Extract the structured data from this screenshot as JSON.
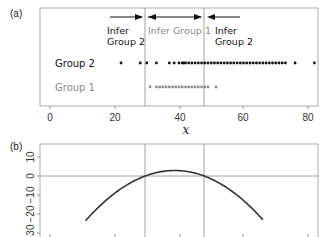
{
  "chart_data": [
    {
      "panel": "(a)",
      "type": "scatter",
      "title": "",
      "xlabel": "x",
      "ylabel": "",
      "xlim": [
        -3,
        83
      ],
      "x_ticks": [
        0,
        20,
        40,
        60,
        80
      ],
      "grid": false,
      "legend": null,
      "vertical_lines": [
        29.5,
        47.8
      ],
      "rows": [
        "Group 2",
        "Group 1"
      ],
      "annotations": [
        {
          "text": "Infer Group 2",
          "arrow": "right",
          "region": "x < 29.5",
          "color": "#111111"
        },
        {
          "text": "Infer Group 1",
          "arrow": "both",
          "region": "29.5 < x < 47.8",
          "color": "#8a8a8a"
        },
        {
          "text": "Infer Group 2",
          "arrow": "left",
          "region": "x > 47.8",
          "color": "#111111"
        }
      ],
      "series": [
        {
          "name": "Group 2",
          "color": "#111111",
          "values": [
            22,
            28,
            30,
            33,
            37,
            38.5,
            40,
            41,
            41.5,
            42,
            43,
            44,
            45,
            46,
            47,
            48,
            49,
            50,
            51,
            52,
            53,
            54,
            55,
            56,
            57,
            58,
            59,
            60,
            61,
            62,
            63,
            64,
            65,
            66,
            67,
            68,
            69,
            70,
            71,
            72,
            73,
            76,
            82
          ]
        },
        {
          "name": "Group 1",
          "color": "#8a8a8a",
          "values": [
            31,
            33,
            34,
            35,
            36,
            37,
            38,
            39,
            40,
            41,
            42,
            43,
            44,
            45,
            46,
            47,
            48,
            49,
            51.5
          ]
        }
      ]
    },
    {
      "panel": "(b)",
      "type": "line",
      "title": "",
      "xlabel": "",
      "ylabel": "",
      "xlim": [
        -3,
        83
      ],
      "ylim": [
        -31,
        17
      ],
      "y_ticks": [
        10,
        0,
        -10,
        -20,
        -30
      ],
      "y_tick_labels": [
        "10",
        "0",
        "−10",
        "−20",
        "−30"
      ],
      "grid": false,
      "horizontal_lines": [
        0
      ],
      "vertical_lines": [
        29.5,
        47.8
      ],
      "series": [
        {
          "name": "log-likelihood ratio (quadratic)",
          "color": "#333333",
          "x": [
            12,
            20,
            29.5,
            35,
            38.6,
            42,
            47.8,
            55,
            65
          ],
          "y": [
            -31,
            -15.7,
            0,
            2.4,
            2.9,
            2.5,
            0,
            -8,
            -31
          ]
        }
      ]
    }
  ],
  "labels": {
    "panel_a": "(a)",
    "panel_b": "(b)",
    "xlabel": "x",
    "group2": "Group 2",
    "group1": "Group 1",
    "infer_left_line1": "Infer",
    "infer_left_line2": "Group 2",
    "infer_mid": "Infer Group 1",
    "infer_right_line1": "Infer",
    "infer_right_line2": "Group 2",
    "xticks": [
      "0",
      "20",
      "40",
      "60",
      "80"
    ],
    "yticks": [
      "10",
      "0",
      "−10",
      "−20",
      "−30"
    ]
  }
}
